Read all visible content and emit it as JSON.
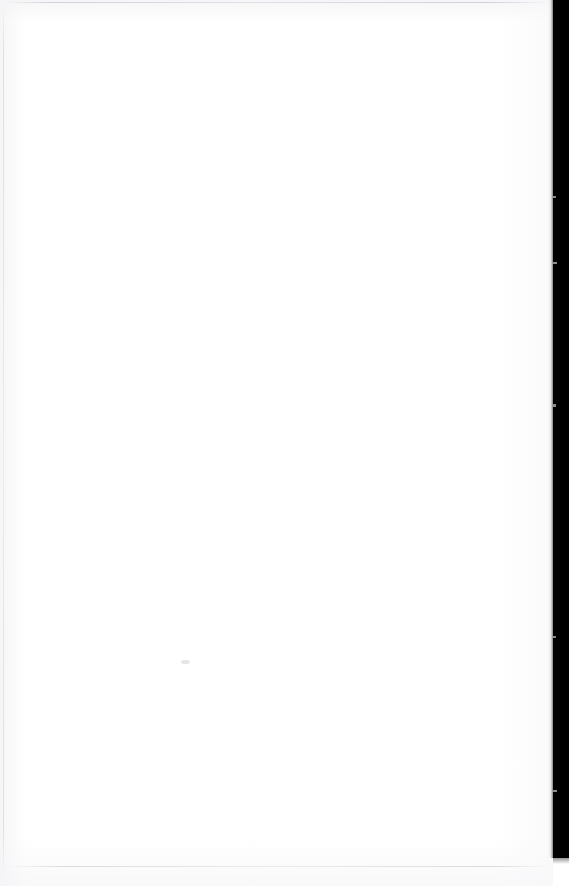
{
  "document": {
    "kind": "scanned-page",
    "page_state": "blank",
    "visible_text": "",
    "text_blocks": [],
    "figures": [],
    "page_number": "",
    "header": "",
    "footer": ""
  },
  "canvas": {
    "width_px": 569,
    "height_px": 886
  },
  "page_sheet": {
    "width_px": 553,
    "height_px": 886,
    "paper_color": "#ffffff"
  },
  "gutter": {
    "name": "right-edge-scanner-gutter",
    "color": "#000000",
    "left_px": 553,
    "top_px": 0,
    "width_px": 16,
    "height_px": 858
  },
  "edge_rules": {
    "color": "#e2e2e4",
    "top": {
      "left_px": 6,
      "top_px": 2,
      "length_px": 545
    },
    "bottom": {
      "left_px": 8,
      "top_px": 866,
      "length_px": 541
    },
    "left": {
      "left_px": 3,
      "top_px": 4,
      "length_px": 874
    }
  },
  "artifacts": {
    "speck": {
      "name": "paper-speck",
      "x_px": 181,
      "y_px": 660,
      "width_px": 9,
      "height_px": 4,
      "color": "#d0d0d4"
    }
  }
}
